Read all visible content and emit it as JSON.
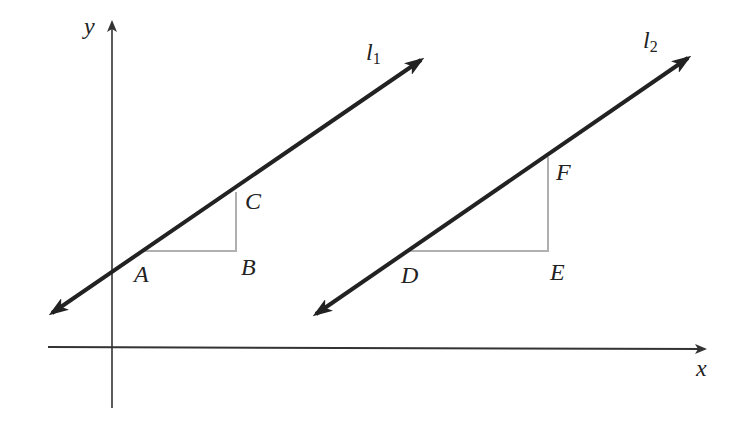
{
  "diagram": {
    "colors": {
      "axis": "#333333",
      "line": "#222222",
      "guide": "#b0b0b0",
      "label": "#222222",
      "background": "#ffffff"
    },
    "axes": {
      "x_label": "x",
      "y_label": "y"
    },
    "lines": [
      {
        "name": "l",
        "subscript": "1"
      },
      {
        "name": "l",
        "subscript": "2"
      }
    ],
    "points": {
      "A": "A",
      "B": "B",
      "C": "C",
      "D": "D",
      "E": "E",
      "F": "F"
    }
  }
}
